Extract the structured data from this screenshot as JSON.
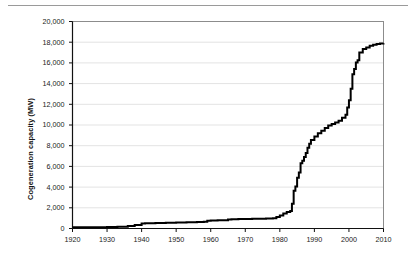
{
  "figure": {
    "top_rule_visible": true,
    "background_color": "#ffffff"
  },
  "chart_data": {
    "type": "line",
    "title": "",
    "subtitle": "",
    "xlabel": "",
    "ylabel": "Cogeneration capacity (MW)",
    "xlim": [
      1920,
      2010
    ],
    "ylim": [
      0,
      20000
    ],
    "grid": true,
    "grid_axis": "y",
    "grid_color": "#e3e3e3",
    "legend": false,
    "legend_position": "none",
    "line_color": "#000000",
    "line_width": 2,
    "step_style": "post",
    "xticks": [
      1920,
      1930,
      1940,
      1950,
      1960,
      1970,
      1980,
      1990,
      2000,
      2010
    ],
    "xtick_labels": [
      "1920",
      "1930",
      "1940",
      "1950",
      "1960",
      "1970",
      "1980",
      "1990",
      "2000",
      "2010"
    ],
    "yticks": [
      0,
      2000,
      4000,
      6000,
      8000,
      10000,
      12000,
      14000,
      16000,
      18000,
      20000
    ],
    "ytick_labels": [
      "0",
      "2,000",
      "4,000",
      "6,000",
      "8,000",
      "10,000",
      "12,000",
      "14,000",
      "16,000",
      "18,000",
      "20,000"
    ],
    "series": [
      {
        "name": "Cumulative cogeneration capacity",
        "x": [
          1920,
          1925,
          1930,
          1933,
          1936,
          1938,
          1940,
          1941,
          1944,
          1947,
          1950,
          1953,
          1956,
          1958,
          1959,
          1960,
          1962,
          1964,
          1965,
          1966,
          1968,
          1970,
          1972,
          1974,
          1976,
          1978,
          1979,
          1980,
          1981,
          1982,
          1983,
          1983.5,
          1984,
          1984.5,
          1985,
          1985.5,
          1986,
          1986.5,
          1987,
          1987.5,
          1988,
          1988.5,
          1989,
          1990,
          1991,
          1992,
          1993,
          1994,
          1995,
          1996,
          1997,
          1998,
          1999,
          1999.5,
          2000,
          2000.5,
          2001,
          2001.5,
          2002,
          2002.5,
          2003,
          2004,
          2005,
          2006,
          2007,
          2008,
          2009,
          2010
        ],
        "values": [
          110,
          120,
          150,
          180,
          240,
          330,
          480,
          500,
          520,
          560,
          590,
          610,
          640,
          660,
          760,
          770,
          790,
          800,
          880,
          900,
          910,
          920,
          930,
          950,
          960,
          1000,
          1100,
          1250,
          1450,
          1600,
          1700,
          2400,
          3650,
          4050,
          4900,
          5400,
          6300,
          6550,
          6900,
          7300,
          7800,
          8200,
          8550,
          8900,
          9200,
          9450,
          9700,
          9950,
          10100,
          10250,
          10400,
          10700,
          11000,
          11700,
          12400,
          13500,
          14900,
          15400,
          16050,
          16250,
          17000,
          17350,
          17500,
          17650,
          17750,
          17820,
          17870,
          17900
        ]
      }
    ],
    "annotations": []
  },
  "axes": {
    "y_title": "Cogeneration capacity (MW)"
  }
}
